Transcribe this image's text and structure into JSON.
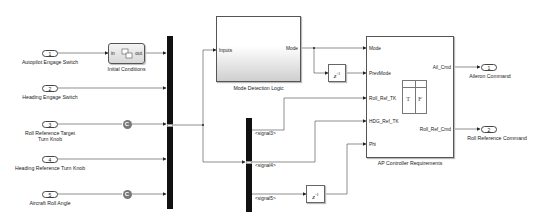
{
  "diagram": {
    "inports": [
      {
        "number": "1",
        "label": "Autopilot Engage Switch"
      },
      {
        "number": "2",
        "label": "Heading Engage Switch"
      },
      {
        "number": "3",
        "label_line1": "Roll Reference Target",
        "label_line2": "Turn Knob"
      },
      {
        "number": "4",
        "label": "Heading Reference Turn Knob"
      },
      {
        "number": "5",
        "label": "Aircraft Roll Angle"
      }
    ],
    "goto_blocks": [
      {
        "symbol": "C"
      },
      {
        "symbol": "C"
      }
    ],
    "initial_conditions": {
      "name": "Initial Conditions",
      "in_port": "in",
      "out_port": "out"
    },
    "mode_detection": {
      "name": "Mode Detection Logic",
      "in_port": "Inputs",
      "out_port": "Mode"
    },
    "unit_delays": [
      {
        "text": "z",
        "exponent": "-1"
      },
      {
        "text": "z",
        "exponent": "-1"
      }
    ],
    "bus_signals": [
      "<signal3>",
      "<signal4>",
      "<signal5>"
    ],
    "ap_controller": {
      "name": "AP Controller Requirements",
      "in_ports": [
        "Mode",
        "PrevMode",
        "Roll_Ref_TK",
        "HDG_Ref_TK",
        "Phi"
      ],
      "out_ports": [
        "Ail_Cmd",
        "Roll_Ref_Cmd"
      ],
      "table_icon": {
        "col1": "T",
        "col2": "F"
      }
    },
    "outports": [
      {
        "number": "1",
        "label": "Aileron Command"
      },
      {
        "number": "2",
        "label": "Roll Reference Command"
      }
    ],
    "colors": {
      "line": "#333333",
      "bus": "#111111",
      "goto": "#777777",
      "block_border": "#555555"
    }
  }
}
